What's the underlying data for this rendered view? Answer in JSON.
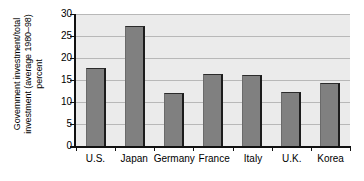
{
  "chart_data": {
    "type": "bar",
    "title": "",
    "subtitle": "",
    "xlabel": "",
    "ylabel": "Government investment/total\ninvestment (average 1980–98)\npercent",
    "ylabel_lines": [
      "Government investment/total",
      "investment (average 1980–98)",
      "percent"
    ],
    "categories": [
      "U.S.",
      "Japan",
      "Germany",
      "France",
      "Italy",
      "U.K.",
      "Korea"
    ],
    "values": [
      17.8,
      27.2,
      12.1,
      16.3,
      16.2,
      12.2,
      14.4
    ],
    "ylim": [
      0,
      30
    ],
    "yticks": [
      0,
      5,
      10,
      15,
      20,
      25,
      30
    ],
    "ytick_labels": [
      "0",
      "5",
      "10",
      "15",
      "20",
      "25",
      "30"
    ],
    "grid": true,
    "grid_axis": "y",
    "legend": false,
    "legend_position": "none",
    "colors": {
      "bar_fill": "#808080",
      "bar_edge": "#1c1c1c",
      "plot_background": "#ebebeb",
      "gridline": "#b8b8b8",
      "axis": "#111111",
      "text": "#000000",
      "figure_background": "#ffffff"
    }
  }
}
